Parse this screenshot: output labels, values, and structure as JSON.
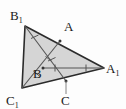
{
  "figure": {
    "type": "geometry-diagram",
    "background_color": "#fdfdfd",
    "fill_color": "#d5d5d5",
    "outline_color": "#2b2b2b",
    "median_color": "#555555",
    "tick_color": "#555555",
    "label_color": "#1a1a1a",
    "vertices": [
      {
        "name": "B1",
        "base": "B",
        "subscript": "1",
        "x": 25,
        "y": 26,
        "label_x": 10,
        "label_y": 16
      },
      {
        "name": "A1",
        "base": "A",
        "subscript": "1",
        "x": 104,
        "y": 68,
        "label_x": 106,
        "label_y": 72
      },
      {
        "name": "C1",
        "base": "C",
        "subscript": "1",
        "x": 22,
        "y": 88,
        "label_x": 7,
        "label_y": 105
      }
    ],
    "midpoints": [
      {
        "name": "A",
        "base": "A",
        "subscript": "",
        "x": 60,
        "y": 41,
        "label_x": 65,
        "label_y": 30
      },
      {
        "name": "B",
        "base": "B",
        "subscript": "",
        "x": 43,
        "y": 68,
        "label_x": 34,
        "label_y": 77
      },
      {
        "name": "C",
        "base": "C",
        "subscript": "",
        "x": 66,
        "y": 81,
        "label_x": 62,
        "label_y": 104
      }
    ],
    "medians": [
      {
        "from": "C1",
        "to": "A",
        "ticks": 2
      },
      {
        "from": "B1",
        "to": "C",
        "ticks": 2
      },
      {
        "from": "B",
        "to": "A1",
        "ticks": 2
      }
    ],
    "leader_lines": [
      {
        "from_x": 66,
        "from_y": 81,
        "to_x": 66,
        "to_y": 95
      }
    ]
  }
}
